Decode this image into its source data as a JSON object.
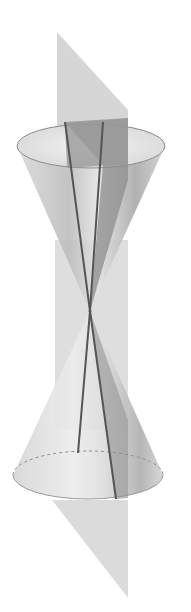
{
  "diagram": {
    "colors": {
      "background": "#ffffff",
      "plane": "#bdbdbd",
      "cone_light": "#e6e6e6",
      "cone_mid": "#c4c4c4",
      "cone_dark": "#9a9a9a",
      "plane_inside_cone": "#8c8c8c",
      "generator_lines": "#555555",
      "rim": "#8a8a8a"
    },
    "geometry": {
      "apex": [
        90,
        311
      ],
      "upper_rim": {
        "cx": 91,
        "cy": 146,
        "rx": 74,
        "ry": 22
      },
      "lower_rim": {
        "cx": 88,
        "cy": 475,
        "rx": 75,
        "ry": 24
      },
      "plane_polygon": "57,32 128,110 128,598 52,505",
      "generator_1": "65,122 90,311 78,453",
      "generator_2": "103,122 90,311 116,499"
    }
  }
}
